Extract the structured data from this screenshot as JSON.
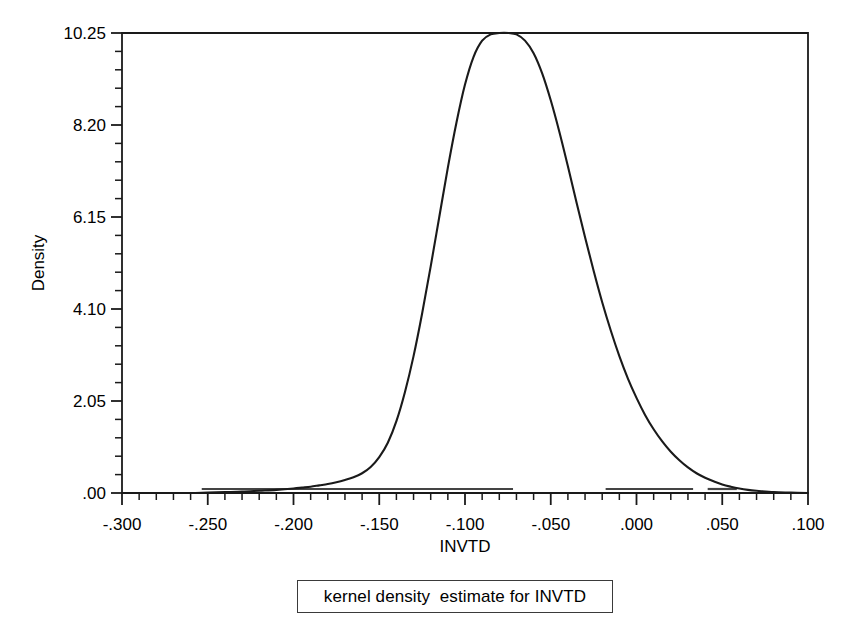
{
  "chart_data": {
    "type": "line",
    "title": "",
    "subtitle": "",
    "xlabel": "INVTD",
    "ylabel": "Density",
    "xlim": [
      -0.3,
      0.1
    ],
    "ylim": [
      0.0,
      10.25
    ],
    "grid": false,
    "legend": null,
    "x_ticks_major": [
      "-.300",
      "-.250",
      "-.200",
      "-.150",
      "-.100",
      "-.050",
      ".000",
      ".050",
      ".100"
    ],
    "x_tick_values": [
      -0.3,
      -0.25,
      -0.2,
      -0.15,
      -0.1,
      -0.05,
      0.0,
      0.05,
      0.1
    ],
    "x_minor_tick_step": 0.01,
    "y_ticks_major": [
      ".00",
      "2.05",
      "4.10",
      "6.15",
      "8.20",
      "10.25"
    ],
    "y_tick_values": [
      0.0,
      2.05,
      4.1,
      6.15,
      8.2,
      10.25
    ],
    "y_minor_tick_step": 0.41,
    "series_name": "kernel density estimate",
    "peak": {
      "x": -0.0745,
      "y": 10.25
    },
    "x": [
      -0.3,
      -0.29,
      -0.28,
      -0.27,
      -0.26,
      -0.25,
      -0.24,
      -0.23,
      -0.22,
      -0.21,
      -0.2,
      -0.195,
      -0.19,
      -0.185,
      -0.18,
      -0.175,
      -0.17,
      -0.165,
      -0.16,
      -0.155,
      -0.15,
      -0.145,
      -0.14,
      -0.135,
      -0.13,
      -0.125,
      -0.12,
      -0.115,
      -0.11,
      -0.105,
      -0.1,
      -0.095,
      -0.09,
      -0.085,
      -0.08,
      -0.0745,
      -0.07,
      -0.065,
      -0.06,
      -0.055,
      -0.05,
      -0.045,
      -0.04,
      -0.035,
      -0.03,
      -0.025,
      -0.02,
      -0.015,
      -0.01,
      -0.005,
      0.0,
      0.005,
      0.01,
      0.015,
      0.02,
      0.025,
      0.03,
      0.035,
      0.04,
      0.045,
      0.05,
      0.055,
      0.06,
      0.065,
      0.07,
      0.08,
      0.09,
      0.1
    ],
    "y": [
      0.0,
      0.0,
      0.0,
      0.0,
      0.0,
      0.01,
      0.02,
      0.03,
      0.05,
      0.07,
      0.1,
      0.12,
      0.14,
      0.17,
      0.2,
      0.24,
      0.29,
      0.35,
      0.44,
      0.58,
      0.8,
      1.12,
      1.6,
      2.25,
      3.05,
      4.0,
      5.05,
      6.15,
      7.25,
      8.25,
      9.1,
      9.72,
      10.08,
      10.22,
      10.25,
      10.25,
      10.22,
      10.08,
      9.8,
      9.35,
      8.75,
      8.05,
      7.28,
      6.48,
      5.7,
      4.95,
      4.25,
      3.62,
      3.05,
      2.55,
      2.12,
      1.74,
      1.42,
      1.15,
      0.92,
      0.73,
      0.57,
      0.44,
      0.34,
      0.26,
      0.19,
      0.14,
      0.1,
      0.07,
      0.05,
      0.02,
      0.01,
      0.0
    ],
    "rug_segments": [
      {
        "from": -0.2535,
        "to": -0.072
      },
      {
        "from": -0.018,
        "to": 0.033
      },
      {
        "from": 0.0415,
        "to": 0.0585
      }
    ],
    "annotations": []
  },
  "caption": {
    "text": "kernel density  estimate for INVTD"
  },
  "colors": {
    "curve": "#1a1a1a",
    "axis": "#1a1a1a",
    "background": "#ffffff",
    "caption_border": "#3a3a3a",
    "text": "#000000"
  }
}
